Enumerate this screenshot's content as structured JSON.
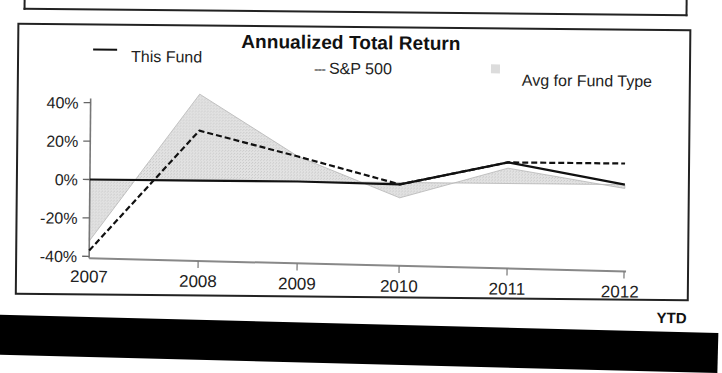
{
  "chart": {
    "title": "Annualized Total Return",
    "legend": {
      "this_fund": "This Fund",
      "sp500_marker": "---",
      "sp500": "S&P 500",
      "avg_fund_type": "Avg for Fund Type"
    },
    "y_ticks": [
      "40%",
      "20%",
      "0%",
      "-20%",
      "-40%"
    ],
    "x_ticks": [
      "2007",
      "2008",
      "2009",
      "2010",
      "2011",
      "2012"
    ],
    "x_suffix": "YTD"
  },
  "colors": {
    "line": "#111111",
    "area_fill": "#dcdcdc",
    "area_edge": "#b5b5b5",
    "frame": "#222222",
    "bottom_bar": "#000000"
  },
  "chart_data": {
    "type": "line",
    "title": "Annualized Total Return",
    "xlabel": "",
    "ylabel": "",
    "categories": [
      "2007",
      "2008",
      "2009",
      "2010",
      "2011",
      "2012 YTD"
    ],
    "ylim": [
      -40,
      40
    ],
    "yticks": [
      -40,
      -20,
      0,
      20,
      40
    ],
    "grid": false,
    "legend_position": "top",
    "series": [
      {
        "name": "This Fund",
        "style": "solid line",
        "values": [
          0,
          0,
          0,
          -1,
          11,
          0
        ]
      },
      {
        "name": "S&P 500",
        "style": "dashed line",
        "values": [
          -37,
          26,
          13,
          -1,
          11,
          11
        ]
      },
      {
        "name": "Avg for Fund Type",
        "style": "shaded area",
        "values": [
          -32,
          45,
          13,
          -8,
          8,
          -2
        ]
      }
    ]
  }
}
